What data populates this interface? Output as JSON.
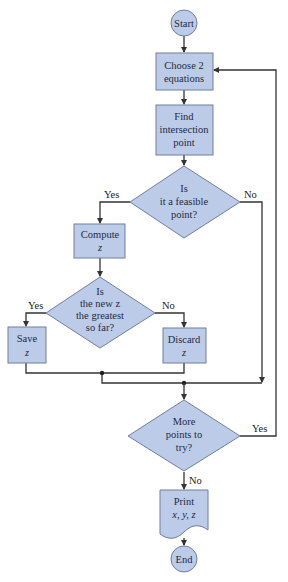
{
  "diagram": {
    "type": "flowchart",
    "nodes": {
      "start": {
        "label": "Start"
      },
      "choose": {
        "line1": "Choose 2",
        "line2": "equations"
      },
      "find": {
        "line1": "Find",
        "line2": "intersection",
        "line3": "point"
      },
      "feasible": {
        "line1": "Is",
        "line2": "it a feasible",
        "line3": "point?"
      },
      "compute": {
        "line1": "Compute",
        "line2": "z"
      },
      "greatest": {
        "line1": "Is",
        "line2": "the new z",
        "line3": "the greatest",
        "line4": "so far?"
      },
      "save": {
        "line1": "Save",
        "line2": "z"
      },
      "discard": {
        "line1": "Discard",
        "line2": "z"
      },
      "more": {
        "line1": "More",
        "line2": "points to",
        "line3": "try?"
      },
      "print": {
        "line1": "Print",
        "line2": "x, y, z"
      },
      "end": {
        "label": "End"
      }
    },
    "edge_labels": {
      "feasible_yes": "Yes",
      "feasible_no": "No",
      "greatest_yes": "Yes",
      "greatest_no": "No",
      "more_yes": "Yes",
      "more_no": "No"
    }
  }
}
